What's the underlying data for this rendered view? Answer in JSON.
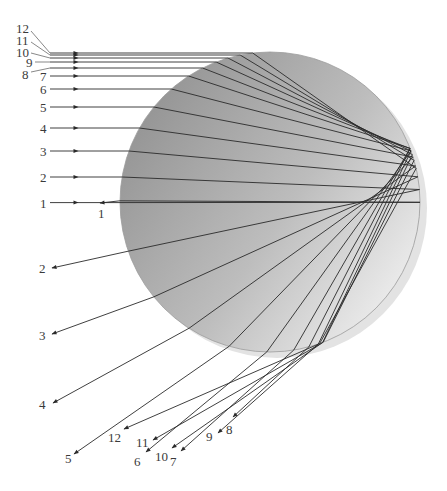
{
  "diagram": {
    "droplet": {
      "cx": 270,
      "cy": 202,
      "r": 150,
      "shadow_offset": [
        7,
        6
      ],
      "gradient_dark": "#8f8f8f",
      "gradient_light": "#f4f4f4",
      "shadow_color": "#e3e3e3",
      "edge_color": "#9a9a9a"
    },
    "ray_color": "#2a2a2a",
    "label_color": "#3a3a3a",
    "entry_x_start": 50,
    "incoming_arrow_x": 78,
    "rays": [
      {
        "id": "1",
        "y": 202.6,
        "in_label": "1",
        "in_label_pos": [
          40,
          197
        ],
        "out_label": "1",
        "out_label_pos": [
          98,
          207
        ],
        "exit_end": [
          100,
          203
        ]
      },
      {
        "id": "2",
        "y": 177,
        "in_label": "2",
        "in_label_pos": [
          40,
          171
        ],
        "out_label": "2",
        "out_label_pos": [
          39,
          262
        ],
        "exit_end": [
          52,
          268
        ]
      },
      {
        "id": "3",
        "y": 151,
        "in_label": "3",
        "in_label_pos": [
          40,
          145
        ],
        "out_label": "3",
        "out_label_pos": [
          39,
          329
        ],
        "exit_end": [
          52,
          334
        ]
      },
      {
        "id": "4",
        "y": 128,
        "in_label": "4",
        "in_label_pos": [
          40,
          122
        ],
        "out_label": "4",
        "out_label_pos": [
          39,
          398
        ],
        "exit_end": [
          53,
          403
        ]
      },
      {
        "id": "5",
        "y": 107,
        "in_label": "5",
        "in_label_pos": [
          40,
          101
        ],
        "out_label": "5",
        "out_label_pos": [
          65,
          452
        ],
        "exit_end": [
          74,
          454
        ]
      },
      {
        "id": "6",
        "y": 89,
        "in_label": "6",
        "in_label_pos": [
          40,
          83
        ],
        "out_label": "6",
        "out_label_pos": [
          134,
          455
        ],
        "exit_end": [
          146,
          452
        ]
      },
      {
        "id": "7",
        "y": 76,
        "in_label": "7",
        "in_label_pos": [
          40,
          70
        ],
        "out_label": "7",
        "out_label_pos": [
          170,
          455
        ],
        "exit_end": [
          181,
          451
        ]
      },
      {
        "id": "8",
        "y": 68,
        "in_label": "8",
        "in_label_pos": [
          22,
          68
        ],
        "out_label": "8",
        "out_label_pos": [
          226,
          423
        ],
        "exit_end": [
          233,
          417
        ]
      },
      {
        "id": "9",
        "y": 62,
        "in_label": "9",
        "in_label_pos": [
          26,
          56
        ],
        "out_label": "9",
        "out_label_pos": [
          206,
          430
        ],
        "exit_end": [
          218,
          433
        ]
      },
      {
        "id": "10",
        "y": 58,
        "in_label": "10",
        "in_label_pos": [
          16,
          46
        ],
        "out_label": "10",
        "out_label_pos": [
          155,
          450
        ],
        "exit_end": [
          172,
          448
        ]
      },
      {
        "id": "11",
        "y": 55,
        "in_label": "11",
        "in_label_pos": [
          16,
          34
        ],
        "out_label": "11",
        "out_label_pos": [
          136,
          436
        ],
        "exit_end": [
          153,
          440
        ]
      },
      {
        "id": "12",
        "y": 53,
        "in_label": "12",
        "in_label_pos": [
          16,
          22
        ],
        "out_label": "12",
        "out_label_pos": [
          108,
          431
        ],
        "exit_end": [
          124,
          429
        ]
      }
    ],
    "label_leaders": [
      {
        "for": "12",
        "from": [
          31,
          31
        ],
        "to": [
          50,
          53
        ]
      },
      {
        "for": "11",
        "from": [
          31,
          42
        ],
        "to": [
          50,
          55
        ]
      },
      {
        "for": "10",
        "from": [
          31,
          53
        ],
        "to": [
          50,
          58
        ]
      },
      {
        "for": "9",
        "from": [
          35,
          62
        ],
        "to": [
          50,
          62
        ]
      },
      {
        "for": "8",
        "from": [
          31,
          72
        ],
        "to": [
          50,
          68
        ]
      },
      {
        "for": "7",
        "from": [
          50,
          76
        ],
        "to": [
          50,
          76
        ]
      }
    ]
  }
}
